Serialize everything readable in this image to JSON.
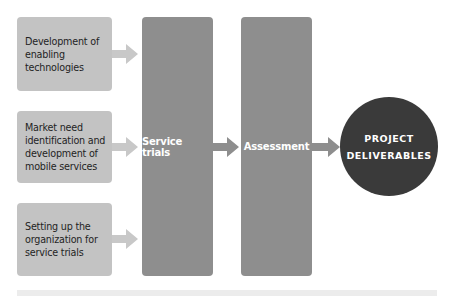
{
  "diagram": {
    "inputs": [
      {
        "label": "Development of enabling technologies",
        "lines": [
          "Development of",
          "enabling",
          "technologies"
        ]
      },
      {
        "label": "Market need identification and development of mobile services",
        "lines": [
          "Market need",
          "identification and",
          "development of",
          "mobile services"
        ]
      },
      {
        "label": "Setting up the organization for service trials",
        "lines": [
          "Setting up the",
          "organization for",
          "service trials"
        ]
      }
    ],
    "stages": [
      {
        "label": "Service trials"
      },
      {
        "label": "Assessment"
      }
    ],
    "output": {
      "lines": [
        "PROJECT",
        "DELIVERABLES"
      ]
    },
    "colors": {
      "input_box": "#c3c3c3",
      "input_arrow": "#c8c8c8",
      "stage_column": "#8e8e8e",
      "stage_arrow": "#8e8e8e",
      "output_circle": "#3a3a3a",
      "bottom_band": "#ececec"
    }
  }
}
